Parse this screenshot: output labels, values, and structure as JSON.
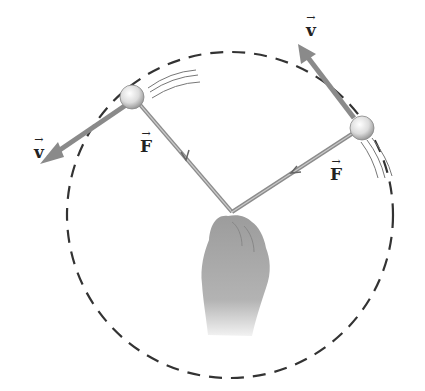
{
  "diagram": {
    "labels": {
      "velocity_left": "v",
      "force_left": "F",
      "velocity_right": "v",
      "force_right": "F",
      "vector_arrow": "→"
    },
    "colors": {
      "velocity_arrow": "#8a8a8a",
      "string": "#9a9a9a",
      "circle_path": "#333333",
      "ball": "#e0e0e0",
      "hand": "#a8a8a8"
    },
    "caption": ""
  }
}
